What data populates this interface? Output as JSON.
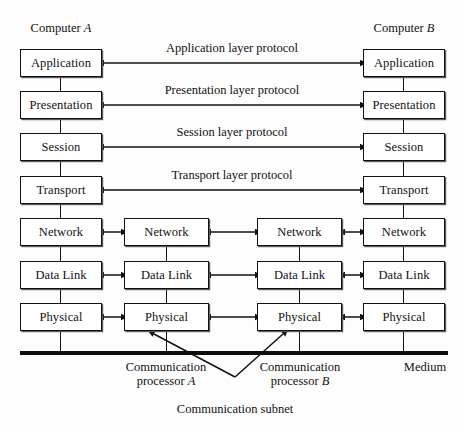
{
  "diagram": {
    "width": 465,
    "height": 433,
    "line_color": "#111111",
    "box_fill": "#ffffff",
    "background": "#fdfdfd"
  },
  "headers": {
    "left": "Computer",
    "left_italic": "A",
    "right": "Computer",
    "right_italic": "B"
  },
  "layers": [
    {
      "name": "Application",
      "protocol": "Application layer protocol"
    },
    {
      "name": "Presentation",
      "protocol": "Presentation layer protocol"
    },
    {
      "name": "Session",
      "protocol": "Session layer protocol"
    },
    {
      "name": "Transport",
      "protocol": "Transport layer protocol"
    },
    {
      "name": "Network",
      "protocol": ""
    },
    {
      "name": "Data Link",
      "protocol": ""
    },
    {
      "name": "Physical",
      "protocol": ""
    }
  ],
  "columns": [
    {
      "id": "computer-a",
      "label": "Computer A"
    },
    {
      "id": "communication-processor-a",
      "label": "Communication processor A"
    },
    {
      "id": "communication-processor-b",
      "label": "Communication processor B"
    },
    {
      "id": "computer-b",
      "label": "Computer B"
    }
  ],
  "nodes": {
    "col_a": [
      "Application",
      "Presentation",
      "Session",
      "Transport",
      "Network",
      "Data Link",
      "Physical"
    ],
    "col_cp_a": [
      "Network",
      "Data Link",
      "Physical"
    ],
    "col_cp_b": [
      "Network",
      "Data Link",
      "Physical"
    ],
    "col_b": [
      "Application",
      "Presentation",
      "Session",
      "Transport",
      "Network",
      "Data Link",
      "Physical"
    ]
  },
  "footer": {
    "processor_a_line1": "Communication",
    "processor_a_line2": "processor",
    "processor_a_italic": "A",
    "processor_b_line1": "Communication",
    "processor_b_line2": "processor",
    "processor_b_italic": "B",
    "medium": "Medium",
    "subnet": "Communication subnet"
  }
}
